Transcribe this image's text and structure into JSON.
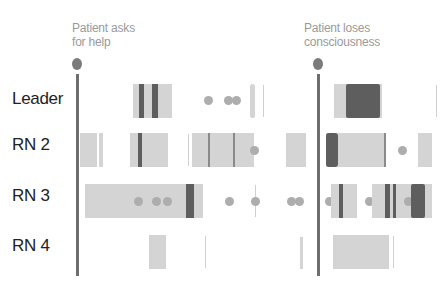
{
  "events": [
    {
      "label_line1": "Patient asks",
      "label_line2": "for help",
      "x": 78
    },
    {
      "label_line1": "Patient loses",
      "label_line2": "consciousness",
      "x": 318
    }
  ],
  "rows": [
    {
      "label": "Leader"
    },
    {
      "label": "RN 2"
    },
    {
      "label": "RN 3"
    },
    {
      "label": "RN 4"
    }
  ],
  "colors": {
    "marker": "#7b7b7b",
    "dark_segment": "#5e5e5e",
    "light_segment": "#d4d4d4",
    "dot": "#adadad",
    "row_label": "#222222",
    "event_label": "#9a9a9a"
  }
}
